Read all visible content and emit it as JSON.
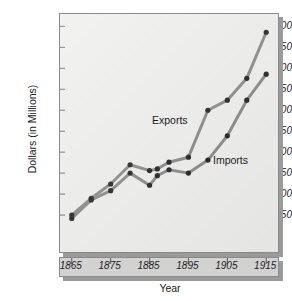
{
  "chart_data": {
    "type": "line",
    "title": "",
    "xlabel": "Year",
    "ylabel": "Dollars (in Millions)",
    "xlim": [
      1863,
      1917
    ],
    "ylim": [
      0,
      2600
    ],
    "grid": false,
    "legend_position": "inline-annotation",
    "xticks": [
      1865,
      1875,
      1885,
      1895,
      1905,
      1915
    ],
    "xtick_labels": [
      "1865",
      "1875",
      "1885",
      "1895",
      "1905",
      "1915"
    ],
    "yticks": [
      250,
      500,
      750,
      1000,
      1250,
      1500,
      1750,
      2000,
      2250,
      2500
    ],
    "ytick_labels": [
      "250",
      "500",
      "750",
      "1000",
      "1250",
      "1500",
      "1750",
      "2000",
      "2250",
      "2500"
    ],
    "x": [
      1865,
      1870,
      1875,
      1880,
      1885,
      1887,
      1890,
      1895,
      1900,
      1905,
      1910,
      1915
    ],
    "series": [
      {
        "name": "Exports",
        "color": "#808080",
        "marker": "circle",
        "values": [
          250,
          450,
          620,
          850,
          780,
          800,
          880,
          940,
          1500,
          1620,
          1880,
          2430
        ]
      },
      {
        "name": "Imports",
        "color": "#808080",
        "marker": "circle",
        "values": [
          210,
          430,
          540,
          750,
          605,
          720,
          790,
          750,
          905,
          1195,
          1620,
          1930
        ]
      }
    ],
    "annotations": [
      {
        "text": "Exports",
        "x": 1892,
        "y": 1290
      },
      {
        "text": "Imports",
        "x": 1903,
        "y": 1000
      }
    ]
  },
  "style": {
    "panel_background": "#ececeb",
    "panel_border": "#8a8a8a",
    "shadow_color": "#9a9a9a",
    "axis_strip_background": "#d2d2d1",
    "line_color": "#808080",
    "marker_color": "#111111",
    "text_color": "#1b1b1b"
  }
}
